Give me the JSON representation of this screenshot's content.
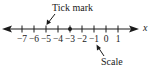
{
  "diagram": {
    "axis_variable": "x",
    "annotations": [
      {
        "id": "tick-mark",
        "text": "Tick mark"
      },
      {
        "id": "scale",
        "text": "Scale"
      }
    ],
    "ticks": [
      {
        "label": "−7",
        "value": -7,
        "x": 22
      },
      {
        "label": "−6",
        "value": -6,
        "x": 34
      },
      {
        "label": "−5",
        "value": -5,
        "x": 46
      },
      {
        "label": "−4",
        "value": -4,
        "x": 58
      },
      {
        "label": "−3",
        "value": -3,
        "x": 70
      },
      {
        "label": "−2",
        "value": -2,
        "x": 82
      },
      {
        "label": "−1",
        "value": -1,
        "x": 94
      },
      {
        "label": "0",
        "value": 0,
        "x": 106
      },
      {
        "label": "1",
        "value": 1,
        "x": 118
      }
    ],
    "highlighted_point": {
      "value": -3
    },
    "colors": {
      "ink": "#1a1a1a",
      "background": "#ffffff"
    }
  }
}
